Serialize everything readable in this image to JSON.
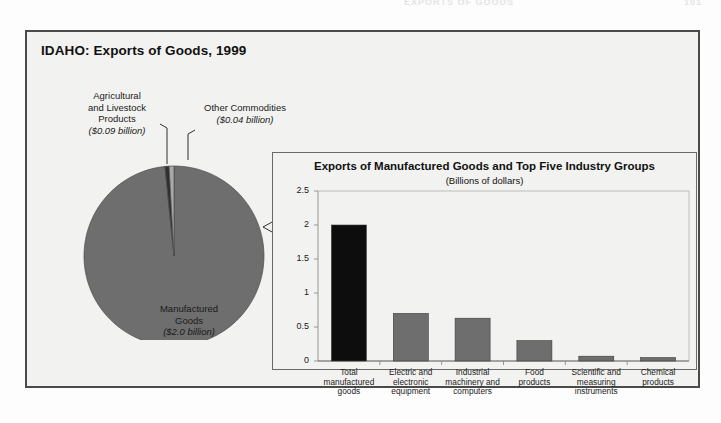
{
  "running_head": {
    "text": "EXPORTS OF GOODS",
    "page_number": "101"
  },
  "figure": {
    "title": "IDAHO: Exports of Goods, 1999"
  },
  "pie": {
    "labels": {
      "agricultural": {
        "name": "Agricultural\nand Livestock\nProducts",
        "line1": "Agricultural",
        "line2": "and Livestock",
        "line3": "Products",
        "amount": "($0.09 billion)"
      },
      "other": {
        "line1": "Other Commodities",
        "amount": "($0.04 billion)"
      },
      "manufactured": {
        "line1": "Manufactured",
        "line2": "Goods",
        "amount": "($2.0 billion)"
      }
    }
  },
  "bar_panel": {
    "title": "Exports of Manufactured Goods and Top Five Industry Groups",
    "subtitle": "(Billions of dollars)"
  },
  "colors": {
    "manufactured_slice": "#6e6e6e",
    "agricultural_slice": "#2f2f2f",
    "other_slice": "#a9a9a9",
    "total_bar": "#0d0d0d",
    "industry_bar": "#6e6e6e",
    "frame": "#4a4a4a",
    "panel_bg": "#f2f2f0"
  },
  "chart_data": [
    {
      "type": "pie",
      "title": "IDAHO: Exports of Goods, 1999",
      "unit": "Billions of dollars",
      "legend": "labels-with-leader-lines",
      "categories": [
        "Manufactured Goods",
        "Agricultural and Livestock Products",
        "Other Commodities"
      ],
      "values": [
        2.0,
        0.09,
        0.04
      ],
      "value_labels": [
        "($2.0 billion)",
        "($0.09 billion)",
        "($0.04 billion)"
      ],
      "colors": [
        "#6e6e6e",
        "#2f2f2f",
        "#a9a9a9"
      ]
    },
    {
      "type": "bar",
      "title": "Exports of Manufactured Goods and Top Five Industry Groups",
      "subtitle": "(Billions of dollars)",
      "xlabel": "",
      "ylabel": "",
      "ylim": [
        0,
        2.5
      ],
      "yticks": [
        0,
        0.5,
        1,
        1.5,
        2,
        2.5
      ],
      "ytick_labels": [
        "0",
        "0.5",
        "1",
        "1.5",
        "2",
        "2.5"
      ],
      "grid": false,
      "categories": [
        "Total manufactured goods",
        "Electric and electronic equipment",
        "Industrial machinery and computers",
        "Food products",
        "Scientific and measuring instruments",
        "Chemical products"
      ],
      "category_lines": [
        [
          "Total",
          "manufactured",
          "goods"
        ],
        [
          "Electric and",
          "electronic",
          "equipment"
        ],
        [
          "Industrial",
          "machinery and",
          "computers"
        ],
        [
          "Food",
          "products"
        ],
        [
          "Scientific and",
          "measuring",
          "instruments"
        ],
        [
          "Chemical",
          "products"
        ]
      ],
      "values": [
        2.0,
        0.7,
        0.63,
        0.3,
        0.07,
        0.05
      ],
      "bar_colors": [
        "#0d0d0d",
        "#6e6e6e",
        "#6e6e6e",
        "#6e6e6e",
        "#6e6e6e",
        "#6e6e6e"
      ]
    }
  ]
}
